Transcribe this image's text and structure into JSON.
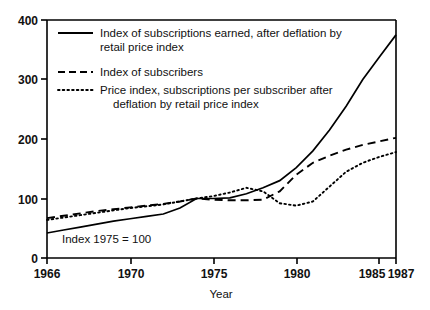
{
  "chart_data": {
    "type": "line",
    "title": "",
    "xlabel": "Year",
    "ylabel": "",
    "xlim": [
      1966,
      1987
    ],
    "ylim": [
      0,
      400
    ],
    "grid": false,
    "legend_position": "top-left inside plot area",
    "annotation": "Index 1975 = 100",
    "xticks": [
      1966,
      1970,
      1975,
      1980,
      1985,
      1987
    ],
    "xtick_labels": [
      "1966",
      "1970",
      "1975",
      "1980",
      "1985",
      "1987"
    ],
    "yticks": [
      0,
      100,
      200,
      300,
      400
    ],
    "ytick_labels": [
      "0",
      "100",
      "200",
      "300",
      "400"
    ],
    "x": [
      1966,
      1967,
      1968,
      1969,
      1970,
      1971,
      1972,
      1973,
      1974,
      1975,
      1976,
      1977,
      1978,
      1979,
      1980,
      1981,
      1982,
      1983,
      1984,
      1985,
      1986,
      1987
    ],
    "series": [
      {
        "name": "Index of subscriptions earned, after deflation by retail price index",
        "style": "solid",
        "color": "#000000",
        "values": [
          42,
          47,
          52,
          57,
          62,
          66,
          70,
          74,
          84,
          100,
          100,
          101,
          108,
          118,
          130,
          152,
          180,
          215,
          255,
          300,
          338,
          375
        ]
      },
      {
        "name": "Index of subscribers",
        "style": "dashed",
        "color": "#000000",
        "values": [
          67,
          71,
          75,
          79,
          82,
          85,
          88,
          91,
          95,
          100,
          98,
          97,
          97,
          98,
          112,
          140,
          160,
          172,
          182,
          190,
          196,
          202
        ]
      },
      {
        "name": "Price index, subscriptions per subscriber after deflation by retail price index",
        "style": "dotted",
        "color": "#000000",
        "values": [
          64,
          68,
          72,
          76,
          80,
          84,
          87,
          90,
          95,
          100,
          104,
          110,
          118,
          112,
          92,
          88,
          95,
          120,
          145,
          160,
          170,
          178
        ]
      }
    ]
  },
  "axis": {
    "x_title": "Year",
    "annotation": "Index 1975 = 100"
  },
  "legend": {
    "items": [
      {
        "style": "solid",
        "line1": "Index of subscriptions earned, after deflation by",
        "line2": "retail price index"
      },
      {
        "style": "dashed",
        "line1": "Index of subscribers",
        "line2": ""
      },
      {
        "style": "dotted",
        "line1": "Price index, subscriptions per subscriber after",
        "line2": "deflation by retail price index"
      }
    ]
  },
  "ticks": {
    "y": [
      "400",
      "300",
      "200",
      "100",
      "0"
    ],
    "x": [
      "1966",
      "1970",
      "1975",
      "1980",
      "1985",
      "1987"
    ]
  }
}
